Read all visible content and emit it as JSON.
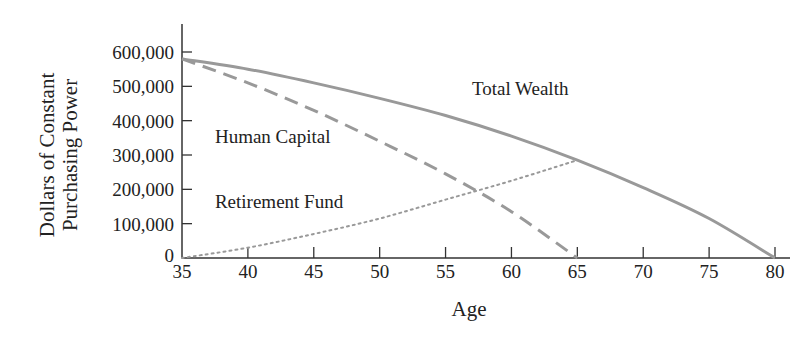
{
  "chart_data": {
    "type": "line",
    "title": "",
    "xlabel": "Age",
    "ylabel": "Dollars of Constant Purchasing Power",
    "ylabel_lines": [
      "Dollars of Constant",
      "Purchasing Power"
    ],
    "xlim": [
      35,
      80
    ],
    "ylim": [
      0,
      600000
    ],
    "x_ticks": [
      35,
      40,
      45,
      50,
      55,
      60,
      65,
      70,
      75,
      80
    ],
    "x_tick_labels": [
      "35",
      "40",
      "45",
      "50",
      "55",
      "60",
      "65",
      "70",
      "75",
      "80"
    ],
    "y_ticks": [
      0,
      100000,
      200000,
      300000,
      400000,
      500000,
      600000
    ],
    "y_tick_labels": [
      "0",
      "100,000",
      "200,000",
      "300,000",
      "400,000",
      "500,000",
      "600,000"
    ],
    "grid": false,
    "legend": "inline labels",
    "series": [
      {
        "name": "Total Wealth",
        "style": "solid",
        "color": "#999999",
        "x": [
          35,
          40,
          45,
          50,
          55,
          60,
          65,
          70,
          75,
          80
        ],
        "values": [
          580000,
          550000,
          510000,
          465000,
          415000,
          355000,
          285000,
          205000,
          115000,
          0
        ]
      },
      {
        "name": "Human Capital",
        "style": "dashed",
        "color": "#999999",
        "x": [
          35,
          40,
          45,
          50,
          55,
          60,
          65
        ],
        "values": [
          580000,
          510000,
          430000,
          340000,
          245000,
          135000,
          0
        ]
      },
      {
        "name": "Retirement Fund",
        "style": "dotted",
        "color": "#999999",
        "x": [
          35,
          40,
          45,
          50,
          55,
          60,
          65
        ],
        "values": [
          0,
          30000,
          70000,
          115000,
          170000,
          225000,
          285000
        ]
      }
    ],
    "annotations": [
      {
        "text": "Total Wealth",
        "x": 57,
        "y": 475000
      },
      {
        "text": "Human Capital",
        "x": 37.5,
        "y": 335000
      },
      {
        "text": "Retirement Fund",
        "x": 37.5,
        "y": 145000
      }
    ]
  }
}
